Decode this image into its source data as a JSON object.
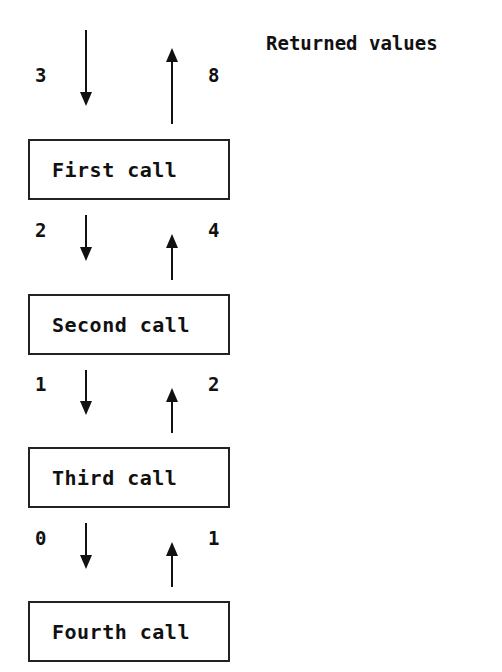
{
  "title": "Returned values",
  "calls": [
    {
      "label": "First call",
      "arg": "3",
      "returned": "8"
    },
    {
      "label": "Second call",
      "arg": "2",
      "returned": "4"
    },
    {
      "label": "Third call",
      "arg": "1",
      "returned": "2"
    },
    {
      "label": "Fourth call",
      "arg": "0",
      "returned": "1"
    }
  ]
}
